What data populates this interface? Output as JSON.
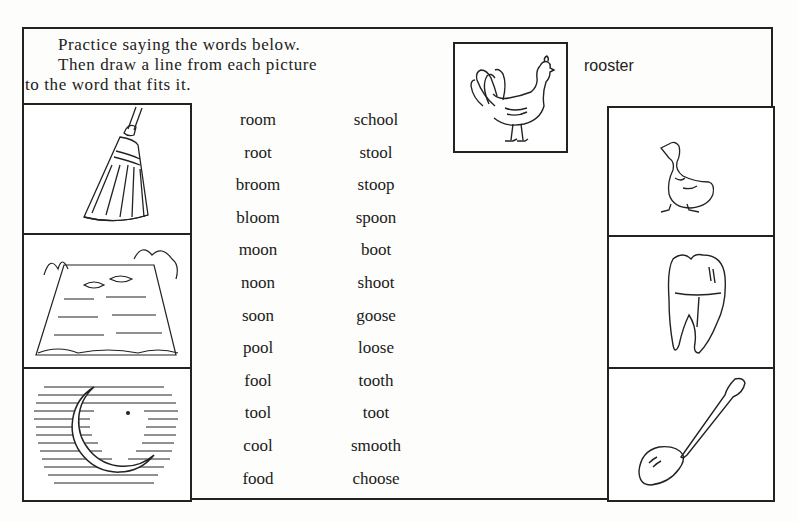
{
  "instructions": {
    "line1": "Practice saying the words below.",
    "line2": "Then draw a line from each picture",
    "line3": "to the word that fits it."
  },
  "example": {
    "picture": "rooster-picture",
    "label": "rooster"
  },
  "left_pictures": [
    "broom-picture",
    "pool-picture",
    "moon-picture"
  ],
  "right_pictures": [
    "goose-picture",
    "tooth-picture",
    "spoon-picture"
  ],
  "words": {
    "column1": [
      "room",
      "root",
      "broom",
      "bloom",
      "moon",
      "noon",
      "soon",
      "pool",
      "fool",
      "tool",
      "cool",
      "food"
    ],
    "column2": [
      "school",
      "stool",
      "stoop",
      "spoon",
      "boot",
      "shoot",
      "goose",
      "loose",
      "tooth",
      "toot",
      "smooth",
      "choose"
    ]
  }
}
